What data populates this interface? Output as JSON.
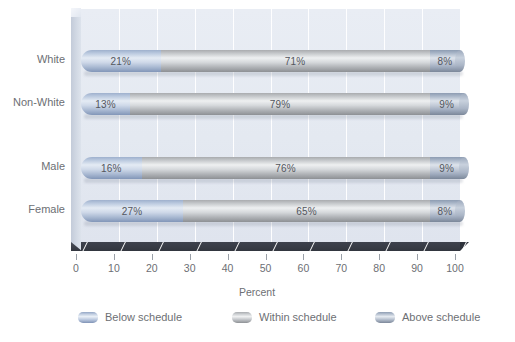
{
  "chart_data": {
    "type": "bar",
    "orientation": "horizontal",
    "stacked": true,
    "title": "",
    "xlabel": "Percent",
    "ylabel": "",
    "xlim": [
      0,
      100
    ],
    "xticks": [
      "0",
      "10",
      "20",
      "30",
      "40",
      "50",
      "60",
      "70",
      "80",
      "90",
      "100"
    ],
    "grid": "vertical",
    "legend_position": "bottom",
    "categories": [
      "White",
      "Non-White",
      "Male",
      "Female"
    ],
    "series": [
      {
        "name": "Below schedule",
        "values": [
          21,
          13,
          16,
          27
        ]
      },
      {
        "name": "Within schedule",
        "values": [
          71,
          79,
          76,
          65
        ]
      },
      {
        "name": "Above schedule",
        "values": [
          8,
          9,
          9,
          8
        ]
      }
    ],
    "data_labels": [
      {
        "category": "White",
        "below": "21%",
        "within": "71%",
        "above": "8%"
      },
      {
        "category": "Non-White",
        "below": "13%",
        "within": "79%",
        "above": "9%"
      },
      {
        "category": "Male",
        "below": "16%",
        "within": "76%",
        "above": "9%"
      },
      {
        "category": "Female",
        "below": "27%",
        "within": "65%",
        "above": "8%"
      }
    ],
    "colors": {
      "below": "#b5c4dd",
      "within": "#c9cccf",
      "above": "#aab5c6",
      "plot_background": "#e4e9f1",
      "gridline": "#ffffff",
      "floor": "#363a44",
      "text": "#6d6f74"
    }
  },
  "axis": {
    "x_title": "Percent",
    "ticks": [
      {
        "label": "0"
      },
      {
        "label": "10"
      },
      {
        "label": "20"
      },
      {
        "label": "30"
      },
      {
        "label": "40"
      },
      {
        "label": "50"
      },
      {
        "label": "60"
      },
      {
        "label": "70"
      },
      {
        "label": "80"
      },
      {
        "label": "90"
      },
      {
        "label": "100"
      }
    ]
  },
  "rows": [
    {
      "label": "White",
      "segments": [
        {
          "key": "below",
          "label": "21%",
          "value": 21
        },
        {
          "key": "within",
          "label": "71%",
          "value": 71
        },
        {
          "key": "above",
          "label": "8%",
          "value": 8
        }
      ]
    },
    {
      "label": "Non-White",
      "segments": [
        {
          "key": "below",
          "label": "13%",
          "value": 13
        },
        {
          "key": "within",
          "label": "79%",
          "value": 79
        },
        {
          "key": "above",
          "label": "9%",
          "value": 9
        }
      ]
    },
    {
      "label": "Male",
      "segments": [
        {
          "key": "below",
          "label": "16%",
          "value": 16
        },
        {
          "key": "within",
          "label": "76%",
          "value": 76
        },
        {
          "key": "above",
          "label": "9%",
          "value": 9
        }
      ]
    },
    {
      "label": "Female",
      "segments": [
        {
          "key": "below",
          "label": "27%",
          "value": 27
        },
        {
          "key": "within",
          "label": "65%",
          "value": 65
        },
        {
          "key": "above",
          "label": "8%",
          "value": 8
        }
      ]
    }
  ],
  "legend": {
    "items": [
      {
        "label": "Below schedule",
        "key": "below"
      },
      {
        "label": "Within schedule",
        "key": "within"
      },
      {
        "label": "Above schedule",
        "key": "above"
      }
    ]
  }
}
